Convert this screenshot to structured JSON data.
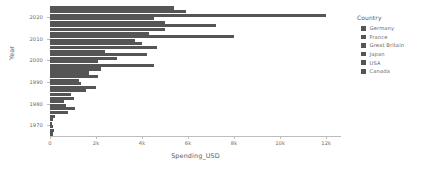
{
  "chart_data": {
    "type": "bar",
    "orientation": "horizontal",
    "title": "",
    "xlabel": "Spending_USD",
    "ylabel": "Year",
    "xlim": [
      0,
      12600
    ],
    "xticks": [
      0,
      2000,
      4000,
      6000,
      8000,
      10000,
      12000
    ],
    "xtick_labels": [
      "0",
      "2k",
      "4k",
      "6k",
      "8k",
      "10k",
      "12k"
    ],
    "categories": [
      "2020",
      "2010",
      "2000",
      "1990",
      "1980",
      "1970"
    ],
    "grid": false,
    "legend_position": "right",
    "legend_title": "Country",
    "series": [
      {
        "name": "Germany",
        "values": [
          5400,
          5000,
          2400,
          1700,
          900,
          220
        ]
      },
      {
        "name": "France",
        "values": [
          5900,
          4300,
          4200,
          2100,
          1050,
          150
        ]
      },
      {
        "name": "Great Britain",
        "values": [
          12000,
          8000,
          2900,
          1250,
          620,
          90
        ]
      },
      {
        "name": "Japan",
        "values": [
          4500,
          3700,
          2100,
          1350,
          700,
          120
        ]
      },
      {
        "name": "USA",
        "values": [
          5000,
          4000,
          4500,
          2000,
          1100,
          180
        ]
      },
      {
        "name": "Canada",
        "values": [
          7200,
          4650,
          2200,
          1550,
          780,
          140
        ]
      }
    ]
  },
  "legend": {
    "title": "Country",
    "items": [
      {
        "label": "Germany",
        "color": "#555555"
      },
      {
        "label": "France",
        "color": "#555555"
      },
      {
        "label": "Great Britain",
        "color": "#555555"
      },
      {
        "label": "Japan",
        "color": "#555555"
      },
      {
        "label": "USA",
        "color": "#555555"
      },
      {
        "label": "Canada",
        "color": "#555555"
      }
    ]
  },
  "axes": {
    "x_title": "Spending_USD",
    "y_title": "Year"
  },
  "colors": {
    "bar": "#555555",
    "axis": "#bdbdbd",
    "text": "#6a6a6a",
    "background": "#ffffff"
  }
}
